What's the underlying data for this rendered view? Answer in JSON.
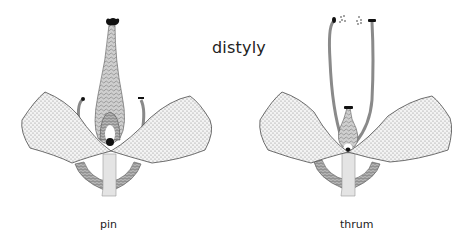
{
  "title": "distyly",
  "flowers": [
    {
      "label": "pin",
      "style": "long",
      "stamens": "short"
    },
    {
      "label": "thrum",
      "style": "short",
      "stamens": "long"
    }
  ],
  "colors": {
    "outline": "#333333",
    "petal_fill": "#e6e6e6",
    "style_fill": "#bdbdbd",
    "stamen": "#8a8a8a",
    "stem": "#e4e4e4",
    "anther": "#111111"
  }
}
